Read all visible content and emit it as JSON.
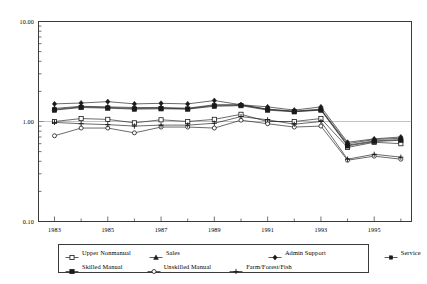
{
  "chart_data": {
    "type": "line",
    "title": "",
    "subtitle": "",
    "xlabel": "",
    "ylabel": "",
    "yscale": "log",
    "ylim": [
      0.1,
      10.0
    ],
    "ytick_labels": [
      "10.00",
      "1.00",
      "0.10"
    ],
    "ytick_values": [
      10.0,
      1.0,
      0.1
    ],
    "xlim": [
      1982.4,
      1996.4
    ],
    "xtick_labels": [
      "1983",
      "1985",
      "1987",
      "1989",
      "1991",
      "1993",
      "1995"
    ],
    "xtick_values": [
      1983,
      1985,
      1987,
      1989,
      1991,
      1993,
      1995
    ],
    "x": [
      1983,
      1984,
      1985,
      1986,
      1987,
      1988,
      1989,
      1990,
      1991,
      1992,
      1993,
      1994,
      1995,
      1996
    ],
    "grid": "horizontal-at-1.00",
    "legend_position": "bottom",
    "series": [
      {
        "name": "Upper Nonmanual",
        "marker": "open-square",
        "values": [
          1.0,
          1.07,
          1.05,
          0.97,
          1.04,
          1.0,
          1.05,
          1.18,
          1.0,
          1.0,
          1.07,
          0.55,
          0.62,
          0.6
        ]
      },
      {
        "name": "Sales",
        "marker": "filled-triangle",
        "values": [
          1.35,
          1.42,
          1.4,
          1.38,
          1.38,
          1.36,
          1.47,
          1.47,
          1.33,
          1.27,
          1.33,
          0.6,
          0.66,
          0.68
        ]
      },
      {
        "name": "Admin Support",
        "marker": "filled-diamond",
        "values": [
          1.5,
          1.53,
          1.58,
          1.5,
          1.52,
          1.5,
          1.62,
          1.47,
          1.4,
          1.3,
          1.4,
          0.62,
          0.67,
          0.7
        ]
      },
      {
        "name": "Service",
        "marker": "filled-square-small",
        "values": [
          1.32,
          1.4,
          1.38,
          1.35,
          1.36,
          1.34,
          1.45,
          1.46,
          1.32,
          1.26,
          1.31,
          0.58,
          0.64,
          0.66
        ]
      },
      {
        "name": "Skilled Manual",
        "marker": "filled-square",
        "values": [
          1.3,
          1.38,
          1.36,
          1.33,
          1.34,
          1.33,
          1.42,
          1.44,
          1.3,
          1.25,
          1.3,
          0.57,
          0.63,
          0.65
        ]
      },
      {
        "name": "Unskilled Manual",
        "marker": "open-circle",
        "values": [
          0.72,
          0.86,
          0.86,
          0.77,
          0.88,
          0.88,
          0.86,
          1.03,
          0.95,
          0.88,
          0.9,
          0.41,
          0.45,
          0.42
        ]
      },
      {
        "name": "Farm/Forest/Fish",
        "marker": "plus",
        "values": [
          0.98,
          0.95,
          0.93,
          0.9,
          0.92,
          0.92,
          0.96,
          1.12,
          1.04,
          0.94,
          1.0,
          0.42,
          0.47,
          0.44
        ]
      }
    ]
  },
  "legend": {
    "rows": [
      [
        {
          "label": "Upper Nonmanual",
          "marker": "open-square"
        },
        {
          "label": "Sales",
          "marker": "filled-triangle"
        },
        {
          "label": "Admin Support",
          "marker": "filled-diamond"
        },
        {
          "label": "Service",
          "marker": "filled-square-small"
        }
      ],
      [
        {
          "label": "Skilled Manual",
          "marker": "filled-square"
        },
        {
          "label": "Unskilled Manual",
          "marker": "open-circle"
        },
        {
          "label": "Farm/Forest/Fish",
          "marker": "plus"
        }
      ]
    ]
  },
  "colors": {
    "line": "#1a1a1a",
    "axis": "#3a3a3a",
    "grid": "#9a9a9a",
    "background": "#ffffff"
  }
}
